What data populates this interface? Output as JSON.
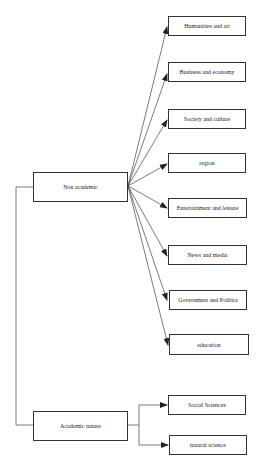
{
  "diagram": {
    "type": "hierarchy",
    "root_groups": [
      {
        "label": "Non academic",
        "children": [
          "Humanities and art",
          "Business and economy",
          "Society and culture",
          "region",
          "Entertainment and leisure",
          "News and media",
          "Government and Politics",
          "education"
        ]
      },
      {
        "label": "Academic nature",
        "children": [
          "Social Sciences",
          "natural science"
        ]
      }
    ]
  },
  "nodes": {
    "non_academic": "Non academic",
    "academic_nature": "Academic nature",
    "humanities": "Humanities and art",
    "business": "Business and economy",
    "society": "Society and culture",
    "region": "region",
    "entertainment": "Entertainment and leisure",
    "news": "News and media",
    "government": "Government and Politics",
    "education": "education",
    "social_sciences": "Social Sciences",
    "natural_science": "natural science"
  },
  "colors": {
    "line": "#333333",
    "background": "#ffffff"
  }
}
